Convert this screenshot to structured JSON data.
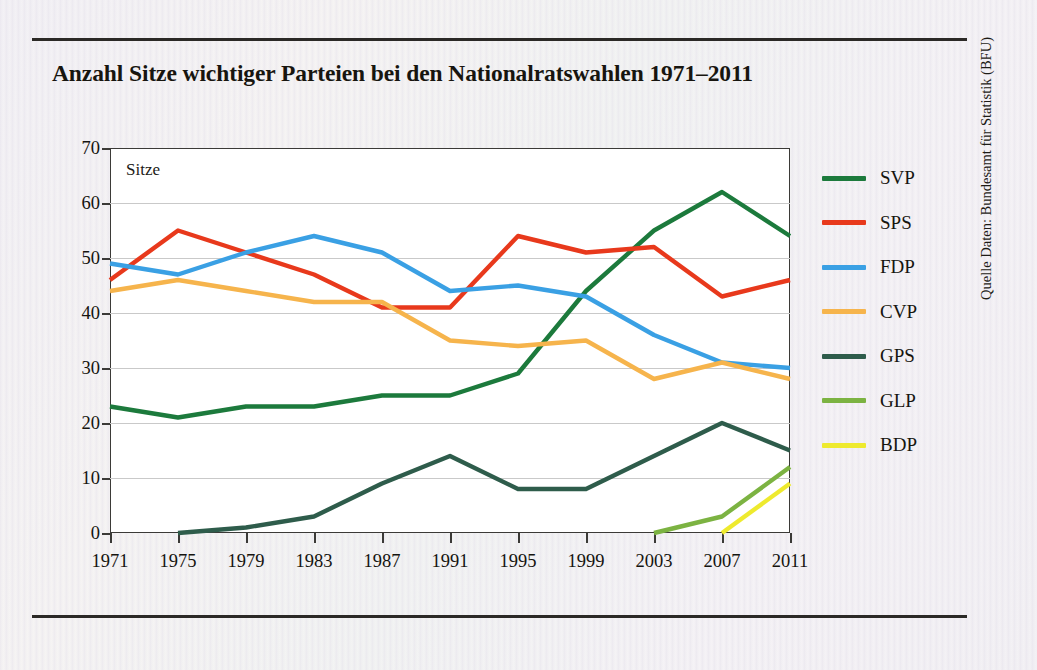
{
  "title": "Anzahl Sitze wichtiger Parteien bei den Nationalratswahlen 1971–2011",
  "plot": {
    "inner_label": "Sitze"
  },
  "source_note": "Quelle Daten: Bundesamt für Statistik (BFU)",
  "legend": {
    "items": [
      {
        "label": "SVP",
        "color": "#1c7a3c"
      },
      {
        "label": "SPS",
        "color": "#e8391c"
      },
      {
        "label": "FDP",
        "color": "#3aa0e4"
      },
      {
        "label": "CVP",
        "color": "#f6b44c"
      },
      {
        "label": "GPS",
        "color": "#2e5c4b"
      },
      {
        "label": "GLP",
        "color": "#7cb342"
      },
      {
        "label": "BDP",
        "color": "#eeea2e"
      }
    ]
  },
  "chart_data": {
    "type": "line",
    "title": "Anzahl Sitze wichtiger Parteien bei den Nationalratswahlen 1971–2011",
    "xlabel": "",
    "ylabel": "Sitze",
    "xlim": [
      1971,
      2011
    ],
    "ylim": [
      0,
      70
    ],
    "yticks": [
      0,
      10,
      20,
      30,
      40,
      50,
      60,
      70
    ],
    "grid": true,
    "legend_position": "right",
    "categories": [
      1971,
      1975,
      1979,
      1983,
      1987,
      1991,
      1995,
      1999,
      2003,
      2007,
      2011
    ],
    "x_tick_labels": [
      "1971",
      "1975",
      "1979",
      "1983",
      "1987",
      "1991",
      "1995",
      "1999",
      "2003",
      "2007",
      "2011"
    ],
    "y_tick_labels": [
      "0",
      "10",
      "20",
      "30",
      "40",
      "50",
      "60",
      "70"
    ],
    "series": [
      {
        "name": "SVP",
        "color": "#1c7a3c",
        "values": [
          23,
          21,
          23,
          23,
          25,
          25,
          29,
          44,
          55,
          62,
          54
        ]
      },
      {
        "name": "SPS",
        "color": "#e8391c",
        "values": [
          46,
          55,
          51,
          47,
          41,
          41,
          54,
          51,
          52,
          43,
          46
        ]
      },
      {
        "name": "FDP",
        "color": "#3aa0e4",
        "values": [
          49,
          47,
          51,
          54,
          51,
          44,
          45,
          43,
          36,
          31,
          30
        ]
      },
      {
        "name": "CVP",
        "color": "#f6b44c",
        "values": [
          44,
          46,
          44,
          42,
          42,
          35,
          34,
          35,
          28,
          31,
          28
        ]
      },
      {
        "name": "GPS",
        "color": "#2e5c4b",
        "values": [
          null,
          0,
          1,
          3,
          9,
          14,
          8,
          8,
          14,
          20,
          15
        ]
      },
      {
        "name": "GLP",
        "color": "#7cb342",
        "values": [
          null,
          null,
          null,
          null,
          null,
          null,
          null,
          null,
          0,
          3,
          12
        ]
      },
      {
        "name": "BDP",
        "color": "#eeea2e",
        "values": [
          null,
          null,
          null,
          null,
          null,
          null,
          null,
          null,
          null,
          0,
          9
        ]
      }
    ]
  }
}
